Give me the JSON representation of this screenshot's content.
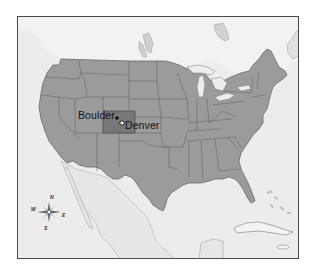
{
  "map": {
    "title": "United States — Colorado highlighted",
    "highlighted_region": "Colorado",
    "colors": {
      "water": "#ececec",
      "land": "#9b9b9b",
      "land_outside_us": "#e4e4e4",
      "highlight": "#777777",
      "borders": "#5e5e5e",
      "frame": "#4a4a4a"
    },
    "cities": [
      {
        "name": "Boulder",
        "marker": "filled-dot"
      },
      {
        "name": "Denver",
        "marker": "open-circle"
      }
    ],
    "compass": {
      "n": "N",
      "s": "S",
      "e": "E",
      "w": "W"
    }
  }
}
